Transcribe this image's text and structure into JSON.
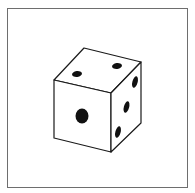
{
  "figure": {
    "colors": {
      "background": "#ffffff",
      "frame_border": "#6e6e6e",
      "outline": "#1a1a1a",
      "pip": "#111111"
    },
    "faces": {
      "top": {
        "pips": 2
      },
      "front": {
        "pips": 1
      },
      "right": {
        "pips": 3
      }
    }
  }
}
